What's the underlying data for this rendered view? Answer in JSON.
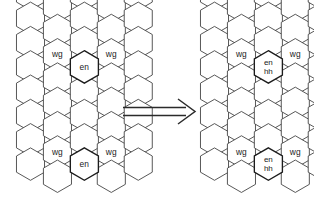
{
  "figure": {
    "arrow": {
      "glyph": "⟹",
      "direction": "right",
      "name": "implies-arrow"
    },
    "colors": {
      "background": "#ffffff",
      "cell_stroke": "#3a3a3a",
      "cell_stroke_bold": "#1c1c1c",
      "label_text": "#1a1a1a",
      "arrow": "#2b2b2b"
    },
    "left_grid": {
      "name": "source-hex-grid",
      "columns": 3,
      "labeled_rows": [
        {
          "row": 1,
          "labels": [
            "wg",
            "wg",
            "wg"
          ]
        },
        {
          "row": 2,
          "labels": [
            "en",
            "en",
            "en"
          ]
        },
        {
          "row": 3,
          "labels": [
            "wg",
            "wg",
            "wg"
          ]
        },
        {
          "row": 4,
          "labels": [
            "en",
            "en",
            "en"
          ]
        }
      ]
    },
    "right_grid": {
      "name": "target-hex-grid",
      "columns": 3,
      "labeled_rows": [
        {
          "row": 1,
          "labels": [
            "wg",
            "wg",
            "wg"
          ]
        },
        {
          "row": 2,
          "labels": [
            "en\nhh",
            "en\nhh",
            "en\nhh"
          ]
        },
        {
          "row": 3,
          "labels": [
            "wg",
            "wg",
            "wg"
          ]
        },
        {
          "row": 4,
          "labels": [
            "en\nhh",
            "en\nhh",
            "en\nhh"
          ]
        }
      ],
      "label_line1": "en",
      "label_line2": "hh"
    },
    "cells": {
      "left": [
        {
          "cx": 31,
          "cy": 24,
          "label": "",
          "bold": false
        },
        {
          "cx": 31,
          "cy": 55,
          "label": "wg",
          "bold": false
        },
        {
          "cx": 31,
          "cy": 86,
          "label": "",
          "bold": false
        },
        {
          "cx": 31,
          "cy": 117,
          "label": "",
          "bold": false
        },
        {
          "cx": 31,
          "cy": 148,
          "label": "",
          "bold": false
        },
        {
          "cx": 31,
          "cy": 179,
          "label": "",
          "bold": false
        },
        {
          "cx": 58,
          "cy": 40,
          "label": "",
          "bold": false
        },
        {
          "cx": 58,
          "cy": 71,
          "label": "en",
          "bold": true
        },
        {
          "cx": 58,
          "cy": 102,
          "label": "",
          "bold": false
        },
        {
          "cx": 58,
          "cy": 133,
          "label": "",
          "bold": false
        },
        {
          "cx": 58,
          "cy": 164,
          "label": "en",
          "bold": true
        },
        {
          "cx": 58,
          "cy": 195,
          "label": "",
          "bold": false
        },
        {
          "cx": 85,
          "cy": 24,
          "label": "",
          "bold": false
        },
        {
          "cx": 85,
          "cy": 55,
          "label": "wg",
          "bold": false
        },
        {
          "cx": 85,
          "cy": 86,
          "label": "",
          "bold": false
        },
        {
          "cx": 85,
          "cy": 117,
          "label": "",
          "bold": false
        },
        {
          "cx": 85,
          "cy": 148,
          "label": "",
          "bold": false
        },
        {
          "cx": 85,
          "cy": 179,
          "label": "",
          "bold": false
        }
      ]
    }
  }
}
